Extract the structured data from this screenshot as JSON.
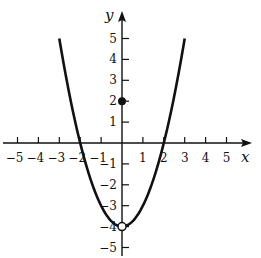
{
  "chart_data": {
    "type": "line",
    "title": "",
    "xlabel": "x",
    "ylabel": "y",
    "xlim": [
      -5,
      5
    ],
    "ylim": [
      -5,
      5
    ],
    "grid": false,
    "x_ticks": [
      -5,
      -4,
      -3,
      -2,
      -1,
      1,
      2,
      3,
      4,
      5
    ],
    "y_ticks": [
      -5,
      -4,
      -3,
      -2,
      -1,
      1,
      2,
      3,
      4,
      5
    ],
    "x_tick_labels": [
      "−5",
      "−4",
      "−3",
      "−2",
      "−1",
      "1",
      "2",
      "3",
      "4",
      "5"
    ],
    "y_tick_labels": [
      "−5",
      "−4",
      "−3",
      "−2",
      "−1",
      "1",
      "2",
      "3",
      "4",
      "5"
    ],
    "series": [
      {
        "name": "f(x) = x² − 4, x ≠ 0",
        "domain": [
          -3,
          3
        ],
        "points": [
          [
            -3,
            5
          ],
          [
            -2.5,
            2.25
          ],
          [
            -2,
            0
          ],
          [
            -1.5,
            -1.75
          ],
          [
            -1,
            -3
          ],
          [
            -0.5,
            -3.75
          ],
          [
            0,
            -4
          ],
          [
            0.5,
            -3.75
          ],
          [
            1,
            -3
          ],
          [
            1.5,
            -1.75
          ],
          [
            2,
            0
          ],
          [
            2.5,
            2.25
          ],
          [
            3,
            5
          ]
        ]
      }
    ],
    "annotations": [
      {
        "type": "open_circle",
        "x": 0,
        "y": -4
      },
      {
        "type": "filled_point",
        "x": 0,
        "y": 2
      }
    ]
  },
  "layout": {
    "origin_px": [
      122,
      143
    ],
    "unit_px": 20.9,
    "line_color": "#111111"
  }
}
